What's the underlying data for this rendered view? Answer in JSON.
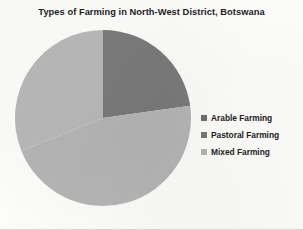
{
  "chart_data": {
    "type": "pie",
    "title": "Types of Farming in North-West District, Botswana",
    "categories": [
      "Arable Farming",
      "Pastoral Farming",
      "Mixed Farming"
    ],
    "values": [
      23,
      46,
      31
    ],
    "value_unit": "percent",
    "legend_position": "right",
    "grid": false,
    "start_angle_deg": 0,
    "direction": "clockwise",
    "slices": [
      {
        "label": "Arable Farming",
        "value": 23,
        "color": "#7a7a7a",
        "start_angle_deg": 0,
        "end_angle_deg": 82
      },
      {
        "label": "Pastoral Farming",
        "value": 46,
        "color": "#b5b5b5",
        "start_angle_deg": 82,
        "end_angle_deg": 248
      },
      {
        "label": "Mixed Farming",
        "value": 31,
        "color": "#b8b8b8",
        "start_angle_deg": 248,
        "end_angle_deg": 360
      }
    ]
  },
  "legend": {
    "items": [
      {
        "label": "Arable Farming",
        "color": "#6f6f6f"
      },
      {
        "label": "Pastoral Farming",
        "color": "#767676"
      },
      {
        "label": "Mixed Farming",
        "color": "#b4b4b4"
      }
    ]
  }
}
